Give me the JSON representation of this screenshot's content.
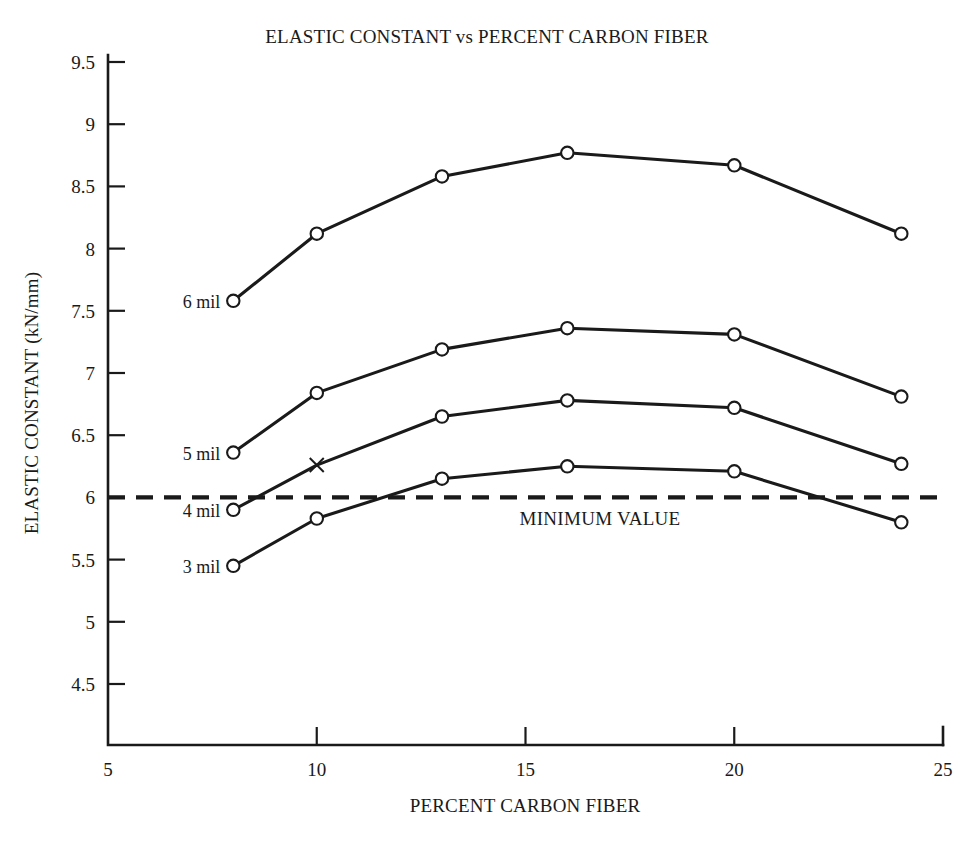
{
  "chart_data": {
    "type": "line",
    "title": "ELASTIC CONSTANT vs PERCENT CARBON FIBER",
    "xlabel": "PERCENT CARBON FIBER",
    "ylabel": "ELASTIC CONSTANT (kN/mm)",
    "xlim": [
      5,
      25
    ],
    "ylim": [
      4.35,
      9.5
    ],
    "grid": false,
    "legend_position": "inline-left-of-first-point",
    "x_ticks": [
      5,
      10,
      15,
      20,
      25
    ],
    "x_tick_labels": [
      "5",
      "10",
      "15",
      "20",
      "25"
    ],
    "y_ticks": [
      4.5,
      5,
      5.5,
      6,
      6.5,
      7,
      7.5,
      8,
      8.5,
      9,
      9.5
    ],
    "y_tick_labels": [
      "4.5",
      "5",
      "5.5",
      "6",
      "6.5",
      "7",
      "7.5",
      "8",
      "8.5",
      "9",
      "9.5"
    ],
    "x": [
      8,
      10,
      13,
      16,
      20,
      24
    ],
    "series": [
      {
        "name": "6 mil",
        "label": "6 mil",
        "marker": "open-circle",
        "values": [
          7.58,
          8.12,
          8.58,
          8.77,
          8.67,
          8.12
        ]
      },
      {
        "name": "5 mil",
        "label": "5 mil",
        "marker": "open-circle",
        "values": [
          6.36,
          6.84,
          7.19,
          7.36,
          7.31,
          6.81
        ]
      },
      {
        "name": "4 mil",
        "label": "4 mil",
        "marker": "open-circle",
        "marker_overrides": {
          "1": "x-cross"
        },
        "values": [
          5.9,
          6.26,
          6.65,
          6.78,
          6.72,
          6.27
        ]
      },
      {
        "name": "3 mil",
        "label": "3 mil",
        "marker": "open-circle",
        "values": [
          5.45,
          5.83,
          6.15,
          6.25,
          6.21,
          5.8
        ]
      }
    ],
    "annotations": [
      {
        "name": "minimum-value-threshold",
        "label": "MINIMUM VALUE",
        "type": "horizontal-dashed-line",
        "y": 6.0,
        "x_start": 5,
        "x_end": 25
      }
    ]
  }
}
